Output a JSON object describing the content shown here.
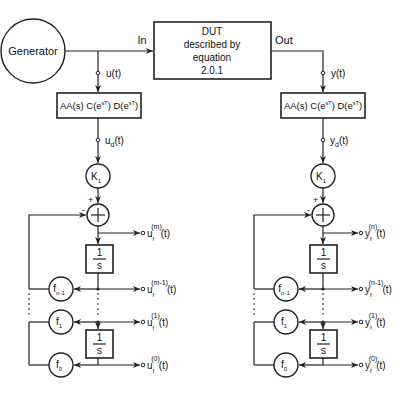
{
  "figure": {
    "type": "block-diagram"
  },
  "generator": {
    "label": "Generator"
  },
  "dut": {
    "lines": [
      "DUT",
      "described by",
      "equation",
      "2.0.1"
    ],
    "in_label": "In",
    "out_label": "Out"
  },
  "left_chain": {
    "signal": "u(t)",
    "filter_block": "AA(s) C(eˢᵀ) D(eˢᵀ)",
    "filter_parts": {
      "a": "AA(s) C(e",
      "sup1": "sT",
      "b": ") D(e",
      "sup2": "sT",
      "c": ")"
    },
    "decimated_signal": {
      "base": "u",
      "sub": "d",
      "arg": "(t)"
    },
    "gain": {
      "base": "K",
      "sub": "1"
    },
    "sum_signs": {
      "plus": "+",
      "minus": "-"
    },
    "integrator_num": "1",
    "integrator_den": "s",
    "outputs": [
      {
        "base": "u",
        "sub": "f",
        "sup": "(m)",
        "arg": "(t)"
      },
      {
        "base": "u",
        "sub": "f",
        "sup": "(m-1)",
        "arg": "(t)"
      },
      {
        "base": "u",
        "sub": "f",
        "sup": "(1)",
        "arg": "(t)"
      },
      {
        "base": "u",
        "sub": "f",
        "sup": "(0)",
        "arg": "(t)"
      }
    ],
    "feedback_gains": [
      {
        "base": "f",
        "sub": "n-1"
      },
      {
        "base": "f",
        "sub": "1"
      },
      {
        "base": "f",
        "sub": "0"
      }
    ]
  },
  "right_chain": {
    "signal": "y(t)",
    "filter_parts": {
      "a": "AA(s) C(e",
      "sup1": "sT",
      "b": ") D(e",
      "sup2": "sT",
      "c": ")"
    },
    "decimated_signal": {
      "base": "y",
      "sub": "d",
      "arg": "(t)"
    },
    "gain": {
      "base": "K",
      "sub": "1"
    },
    "sum_signs": {
      "plus": "+",
      "minus": "-"
    },
    "integrator_num": "1",
    "integrator_den": "s",
    "outputs": [
      {
        "base": "y",
        "sub": "f",
        "sup": "(n)",
        "arg": "(t)"
      },
      {
        "base": "y",
        "sub": "f",
        "sup": "(n-1)",
        "arg": "(t)"
      },
      {
        "base": "y",
        "sub": "f",
        "sup": "(1)",
        "arg": "(t)"
      },
      {
        "base": "y",
        "sub": "f",
        "sup": "(0)",
        "arg": "(t)"
      }
    ],
    "feedback_gains": [
      {
        "base": "f",
        "sub": "n-1"
      },
      {
        "base": "f",
        "sub": "1"
      },
      {
        "base": "f",
        "sub": "0"
      }
    ]
  }
}
